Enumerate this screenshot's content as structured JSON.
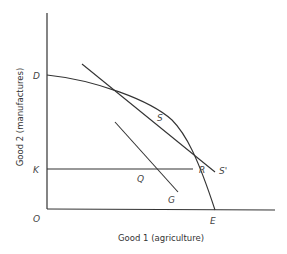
{
  "diagram": {
    "type": "production-possibility-frontier",
    "x_axis": {
      "label": "Good 1 (agriculture)"
    },
    "y_axis": {
      "label": "Good 2 (manufactures)"
    },
    "points": {
      "origin": "O",
      "d": "D",
      "k": "K",
      "s": "S",
      "s_prime": "S'",
      "q": "Q",
      "r": "R",
      "g": "G",
      "e": "E"
    },
    "curves": [
      {
        "name": "transformation-curve",
        "from": "D",
        "through": [
          "S",
          "R"
        ],
        "to": "E"
      },
      {
        "name": "price-line-tangent",
        "through": "S",
        "to": "S'"
      },
      {
        "name": "horizontal-line-K",
        "from": "K",
        "through": [
          "Q"
        ],
        "to": "R"
      },
      {
        "name": "line-QG",
        "through": "Q",
        "to": "G"
      }
    ],
    "colors": {
      "line": "#333333",
      "background": "#ffffff"
    }
  }
}
